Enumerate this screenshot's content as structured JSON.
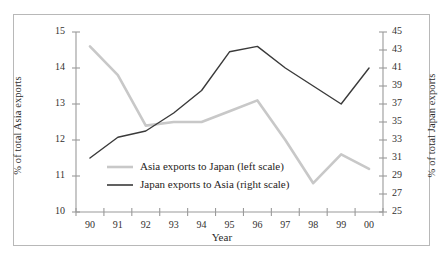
{
  "chart_data": {
    "type": "line",
    "title": "",
    "xlabel": "Year",
    "ylabel": "% of total Asia exports",
    "ylabel_secondary": "% of total Japan exports",
    "categories": [
      "90",
      "91",
      "92",
      "93",
      "94",
      "95",
      "96",
      "97",
      "98",
      "99",
      "00"
    ],
    "ylim": [
      10,
      15
    ],
    "yticks": [
      "10",
      "11",
      "12",
      "13",
      "14",
      "15"
    ],
    "ylim_secondary": [
      25,
      45
    ],
    "yticks_secondary": [
      "25",
      "27",
      "29",
      "31",
      "33",
      "35",
      "37",
      "39",
      "41",
      "43",
      "45"
    ],
    "grid": false,
    "legend_position": "inside-lower-left",
    "series": [
      {
        "name": "Asia exports to Japan (left scale)",
        "axis": "left",
        "color": "#c8c8c8",
        "values": [
          14.6,
          13.8,
          12.4,
          12.5,
          12.5,
          12.8,
          13.1,
          12.0,
          10.8,
          11.6,
          11.2
        ]
      },
      {
        "name": "Japan exports to Asia (right scale)",
        "axis": "right",
        "color": "#3a3a3a",
        "values": [
          31.0,
          33.3,
          34.0,
          36.0,
          38.5,
          42.8,
          43.4,
          41.0,
          39.0,
          37.0,
          41.0
        ]
      }
    ]
  },
  "legend": {
    "items": [
      {
        "label": "Asia exports to Japan (left scale)",
        "color": "#c8c8c8"
      },
      {
        "label": "Japan exports to Asia (right scale)",
        "color": "#3a3a3a"
      }
    ]
  },
  "axes": {
    "left_title": "% of total Asia exports",
    "right_title": "% of total Japan exports",
    "x_title": "Year"
  }
}
